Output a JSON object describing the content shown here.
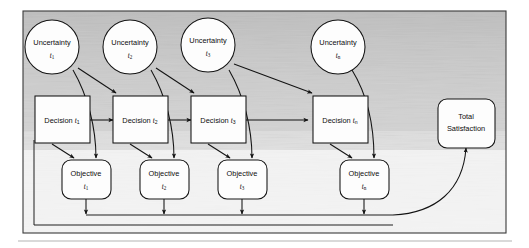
{
  "figure": {
    "kind": "influence-diagram",
    "background_texture": "scanned-grayscale-streaks"
  },
  "nodes": {
    "uncertainty": [
      {
        "label": "Uncertainty",
        "subscript_base": "t",
        "subscript_index": "1"
      },
      {
        "label": "Uncertainty",
        "subscript_base": "t",
        "subscript_index": "2"
      },
      {
        "label": "Uncertainty",
        "subscript_base": "t",
        "subscript_index": "3"
      },
      {
        "label": "Uncertainty",
        "subscript_base": "t",
        "subscript_index": "n"
      }
    ],
    "decision": [
      {
        "label": "Decision",
        "subscript_base": "t",
        "subscript_index": "1"
      },
      {
        "label": "Decision",
        "subscript_base": "t",
        "subscript_index": "2"
      },
      {
        "label": "Decision",
        "subscript_base": "t",
        "subscript_index": "3"
      },
      {
        "label": "Decision",
        "subscript_base": "t",
        "subscript_index": "n"
      }
    ],
    "objective": [
      {
        "label": "Objective",
        "subscript_base": "t",
        "subscript_index": "1"
      },
      {
        "label": "Objective",
        "subscript_base": "t",
        "subscript_index": "2"
      },
      {
        "label": "Objective",
        "subscript_base": "t",
        "subscript_index": "3"
      },
      {
        "label": "Objective",
        "subscript_base": "t",
        "subscript_index": "n"
      }
    ],
    "total": {
      "line1": "Total",
      "line2": "Satisfaction"
    }
  },
  "colors": {
    "stroke": "#131313",
    "node_fill": "#fdfdfd",
    "frame": "#3a3a3a",
    "text": "#0d0d0d"
  }
}
